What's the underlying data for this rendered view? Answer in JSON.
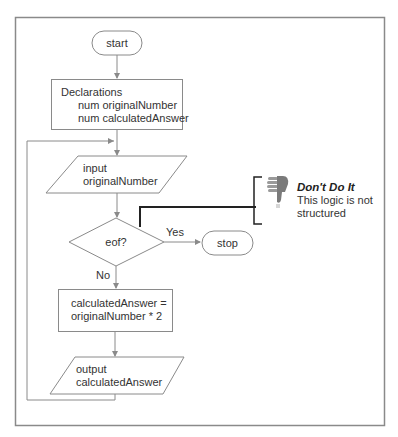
{
  "colors": {
    "frame": "#8a8a8a",
    "shape_stroke": "#8a8a8a",
    "bracket": "#222222",
    "thumb": "#7a7a7a",
    "text": "#333333"
  },
  "flowchart": {
    "start": {
      "label": "start"
    },
    "declarations": {
      "title": "Declarations",
      "lines": [
        "num originalNumber",
        "num calculatedAnswer"
      ]
    },
    "input": {
      "lines": [
        "input",
        "originalNumber"
      ]
    },
    "decision": {
      "label": "eof?",
      "yes_label": "Yes",
      "no_label": "No"
    },
    "stop": {
      "label": "stop"
    },
    "process": {
      "lines": [
        "calculatedAnswer =",
        "originalNumber * 2"
      ]
    },
    "output": {
      "lines": [
        "output",
        "calculatedAnswer"
      ]
    }
  },
  "callout": {
    "icon": "thumbs-down-icon",
    "title": "Don't Do It",
    "lines": [
      "This logic is not",
      "structured"
    ]
  }
}
